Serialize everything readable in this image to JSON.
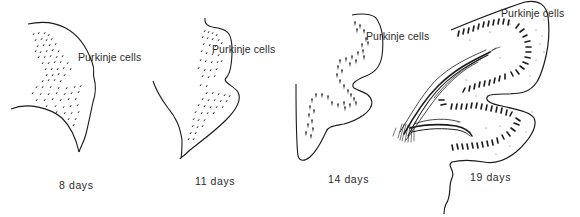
{
  "figure": {
    "panels": [
      {
        "id": "p8",
        "age_label": "8 days",
        "structure_label": "Purkinje cells"
      },
      {
        "id": "p11",
        "age_label": "11 days",
        "structure_label": "Purkinje cells"
      },
      {
        "id": "p14",
        "age_label": "14 days",
        "structure_label": "Purkinje cells"
      },
      {
        "id": "p19",
        "age_label": "19 days",
        "structure_label": "Purkinje cells"
      }
    ],
    "colors": {
      "ink": "#1a1a1a",
      "background": "#ffffff"
    }
  }
}
